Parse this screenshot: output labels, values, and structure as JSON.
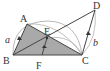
{
  "diagram": {
    "type": "geometry",
    "colors": {
      "line": "#444444",
      "arc": "#999999",
      "fill": "#a9a9a9",
      "background": "#ffffff"
    },
    "points": {
      "A": {
        "label": "A",
        "x": 27,
        "y": 24
      },
      "B": {
        "label": "B",
        "x": 13,
        "y": 55
      },
      "C": {
        "label": "C",
        "x": 82,
        "y": 55
      },
      "D": {
        "label": "D",
        "x": 95,
        "y": 10
      },
      "E": {
        "label": "E",
        "x": 47,
        "y": 38
      },
      "F": {
        "label": "F",
        "x": 42,
        "y": 55
      }
    },
    "vectors": [
      {
        "label": "a",
        "from": "B",
        "to": "A"
      },
      {
        "label": "b",
        "from": "C",
        "to": "D"
      },
      {
        "label": "",
        "from": "F",
        "to": "E"
      }
    ],
    "segments": [
      "A-B",
      "B-C",
      "A-C",
      "B-D",
      "C-D",
      "E-F"
    ],
    "shaded_region": "triangle A-B-C",
    "labels": {
      "A": "A",
      "B": "B",
      "C": "C",
      "D": "D",
      "E": "E",
      "F": "F",
      "a": "a",
      "b": "b"
    }
  }
}
